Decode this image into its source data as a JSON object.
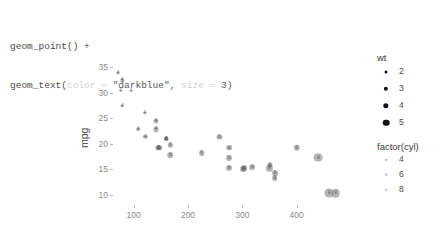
{
  "code": {
    "line1": "geom_point() +",
    "line2_fn": "geom_text(",
    "line2_arg1_name": "color",
    "line2_eq": " = ",
    "line2_arg1_val": "\"darkblue\"",
    "line2_comma": ", ",
    "line2_arg2_name": "size",
    "line2_arg2_val": "3",
    "line2_close": ")"
  },
  "chart_data": {
    "type": "scatter",
    "title": "",
    "xlabel": "disp",
    "ylabel": "mpg",
    "xlim": [
      60,
      480
    ],
    "ylim": [
      9,
      36
    ],
    "xticks": [
      100,
      200,
      300,
      400
    ],
    "yticks": [
      10,
      15,
      20,
      25,
      30,
      35
    ],
    "grid": false,
    "legend_position": "right",
    "size_legend": {
      "title": "wt",
      "values": [
        2,
        3,
        4,
        5
      ],
      "px": [
        3.0,
        4.3,
        5.4,
        6.6
      ]
    },
    "label_legend": {
      "title": "factor(cyl)",
      "values": [
        4,
        6,
        8
      ]
    },
    "series": [
      {
        "name": "mtcars",
        "point_color": "#505050",
        "label_color": "darkblue",
        "label_size": 3,
        "points": [
          {
            "disp": 71.1,
            "mpg": 33.9,
            "wt": 1.835,
            "cyl": 4
          },
          {
            "disp": 78.7,
            "mpg": 32.4,
            "wt": 2.2,
            "cyl": 4
          },
          {
            "disp": 75.7,
            "mpg": 30.4,
            "wt": 1.615,
            "cyl": 4
          },
          {
            "disp": 95.1,
            "mpg": 30.4,
            "wt": 1.513,
            "cyl": 4
          },
          {
            "disp": 79.0,
            "mpg": 27.3,
            "wt": 1.935,
            "cyl": 4
          },
          {
            "disp": 120.3,
            "mpg": 26.0,
            "wt": 2.14,
            "cyl": 4
          },
          {
            "disp": 108.0,
            "mpg": 22.8,
            "wt": 2.32,
            "cyl": 4
          },
          {
            "disp": 140.8,
            "mpg": 24.4,
            "wt": 3.19,
            "cyl": 4
          },
          {
            "disp": 146.7,
            "mpg": 19.2,
            "wt": 3.44,
            "cyl": 6
          },
          {
            "disp": 140.8,
            "mpg": 22.8,
            "wt": 3.15,
            "cyl": 4
          },
          {
            "disp": 160.0,
            "mpg": 21.0,
            "wt": 2.62,
            "cyl": 6
          },
          {
            "disp": 160.0,
            "mpg": 21.0,
            "wt": 2.875,
            "cyl": 6
          },
          {
            "disp": 167.6,
            "mpg": 19.7,
            "wt": 2.77,
            "cyl": 6
          },
          {
            "disp": 167.6,
            "mpg": 17.8,
            "wt": 3.44,
            "cyl": 6
          },
          {
            "disp": 145.0,
            "mpg": 19.2,
            "wt": 3.44,
            "cyl": 6
          },
          {
            "disp": 225.0,
            "mpg": 18.1,
            "wt": 3.46,
            "cyl": 6
          },
          {
            "disp": 258.0,
            "mpg": 21.4,
            "wt": 3.215,
            "cyl": 6
          },
          {
            "disp": 275.8,
            "mpg": 19.2,
            "wt": 3.44,
            "cyl": 8
          },
          {
            "disp": 275.8,
            "mpg": 17.3,
            "wt": 3.73,
            "cyl": 8
          },
          {
            "disp": 275.8,
            "mpg": 15.2,
            "wt": 3.78,
            "cyl": 8
          },
          {
            "disp": 304.0,
            "mpg": 15.2,
            "wt": 3.435,
            "cyl": 8
          },
          {
            "disp": 318.0,
            "mpg": 15.5,
            "wt": 3.52,
            "cyl": 8
          },
          {
            "disp": 350.0,
            "mpg": 15.2,
            "wt": 3.845,
            "cyl": 8
          },
          {
            "disp": 351.0,
            "mpg": 15.8,
            "wt": 3.17,
            "cyl": 8
          },
          {
            "disp": 360.0,
            "mpg": 14.3,
            "wt": 3.57,
            "cyl": 8
          },
          {
            "disp": 360.0,
            "mpg": 13.3,
            "wt": 3.44,
            "cyl": 8
          },
          {
            "disp": 400.0,
            "mpg": 19.2,
            "wt": 3.845,
            "cyl": 8
          },
          {
            "disp": 440.0,
            "mpg": 17.3,
            "wt": 5.345,
            "cyl": 8
          },
          {
            "disp": 460.0,
            "mpg": 10.4,
            "wt": 5.424,
            "cyl": 8
          },
          {
            "disp": 472.0,
            "mpg": 10.4,
            "wt": 5.25,
            "cyl": 8
          },
          {
            "disp": 301.0,
            "mpg": 15.0,
            "wt": 3.57,
            "cyl": 8
          },
          {
            "disp": 121.0,
            "mpg": 21.4,
            "wt": 2.78,
            "cyl": 4
          }
        ]
      }
    ]
  }
}
